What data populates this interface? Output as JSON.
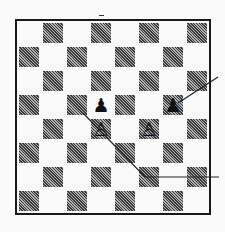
{
  "diagram": {
    "type": "chess-position",
    "board": {
      "files": 8,
      "ranks": 8,
      "bottom_left_color": "dark"
    },
    "pieces": [
      {
        "square": "d5",
        "color": "black",
        "type": "pawn",
        "glyph": "♟"
      },
      {
        "square": "g5",
        "color": "black",
        "type": "pawn",
        "glyph": "♟"
      },
      {
        "square": "d4",
        "color": "white",
        "type": "pawn",
        "glyph": "♙"
      },
      {
        "square": "f4",
        "color": "white",
        "type": "pawn",
        "glyph": "♙"
      }
    ],
    "callout_lines": [
      {
        "from_square": "g5",
        "to": "right-margin-upper"
      },
      {
        "from_square": "d5",
        "to": "right-margin-lower"
      }
    ],
    "colors": {
      "dark_square": "#6e6e6e",
      "light_square": "#fafafa",
      "border": "#1a1a1a"
    }
  }
}
